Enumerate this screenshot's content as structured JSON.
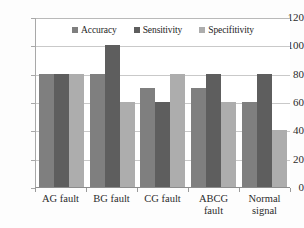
{
  "chart_data": {
    "type": "bar",
    "title": "",
    "subtitle": "",
    "xlabel": "",
    "ylabel": "",
    "ylim": [
      0,
      120
    ],
    "ytick_labels": [
      "120",
      "100",
      "80",
      "60",
      "40",
      "20",
      "0"
    ],
    "ytick_values": [
      120,
      100,
      80,
      60,
      40,
      20,
      0
    ],
    "grid": true,
    "legend_position": "top-center",
    "categories": [
      "AG fault",
      "BG fault",
      "CG fault",
      "ABCG fault",
      "Normal signal"
    ],
    "category_lines": [
      [
        "AG fault"
      ],
      [
        "BG fault"
      ],
      [
        "CG fault"
      ],
      [
        "ABCG fault"
      ],
      [
        "Normal",
        "signal"
      ]
    ],
    "series": [
      {
        "name": "Accuracy",
        "color": "#7f7f7f",
        "values": [
          80,
          80,
          70,
          70,
          60
        ]
      },
      {
        "name": "Sensitivity",
        "color": "#5e5e5e",
        "values": [
          80,
          100,
          60,
          80,
          80
        ]
      },
      {
        "name": "Specifitivity",
        "color": "#adadad",
        "values": [
          80,
          60,
          80,
          60,
          40
        ]
      }
    ]
  },
  "legend": {
    "entries": [
      {
        "label": "Accuracy"
      },
      {
        "label": "Sensitivity"
      },
      {
        "label": "Specifitivity"
      }
    ]
  }
}
